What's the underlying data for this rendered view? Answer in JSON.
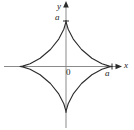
{
  "figure": {
    "type": "math-plot",
    "name": "astroid-curve",
    "background_color": "#ffffff",
    "axis_color": "#808080",
    "curve_color": "#2b2b2b",
    "text_color": "#1a1a1a"
  },
  "axes": {
    "x_axis_label": "x",
    "y_axis_label": "y",
    "origin_label": "0",
    "x_tick_label": "a",
    "y_tick_label": "a"
  },
  "chart_data": {
    "type": "line",
    "title": "",
    "xlabel": "x",
    "ylabel": "y",
    "grid": false,
    "legend": null,
    "annotations": [
      "0",
      "a",
      "a"
    ],
    "curve_equation": "x^(2/3) + y^(2/3) = a^(2/3)",
    "curve_name": "astroid",
    "parametric": {
      "x": "a*cos(t)^3",
      "y": "a*sin(t)^3",
      "t_range": [
        0,
        6.283185307179586
      ]
    },
    "a": 1,
    "xlim": [
      -1.35,
      1.35
    ],
    "ylim": [
      -1.35,
      1.35
    ],
    "cusps": [
      {
        "x": 1,
        "y": 0,
        "label": "a"
      },
      {
        "x": 0,
        "y": 1,
        "label": "a"
      },
      {
        "x": -1,
        "y": 0,
        "label": ""
      },
      {
        "x": 0,
        "y": -1,
        "label": ""
      }
    ],
    "points": [
      {
        "t": 0.0,
        "x": 1.0,
        "y": 0.0
      },
      {
        "t": 0.2,
        "x": 0.9417,
        "y": 0.0078
      },
      {
        "t": 0.4,
        "x": 0.7809,
        "y": 0.0591
      },
      {
        "t": 0.6,
        "x": 0.5622,
        "y": 0.1802
      },
      {
        "t": 0.8,
        "x": 0.3383,
        "y": 0.3694
      },
      {
        "t": 1.0,
        "x": 0.1577,
        "y": 0.5966
      },
      {
        "t": 1.2,
        "x": 0.0476,
        "y": 0.8099
      },
      {
        "t": 1.4,
        "x": 0.0046,
        "y": 0.9575
      },
      {
        "t": 1.5708,
        "x": 0.0,
        "y": 1.0
      },
      {
        "t": 1.7416,
        "x": -0.0046,
        "y": 0.9575
      },
      {
        "t": 1.9416,
        "x": -0.0476,
        "y": 0.8099
      },
      {
        "t": 2.1416,
        "x": -0.1577,
        "y": 0.5966
      },
      {
        "t": 2.3416,
        "x": -0.3383,
        "y": 0.3694
      },
      {
        "t": 2.5416,
        "x": -0.5622,
        "y": 0.1802
      },
      {
        "t": 2.7416,
        "x": -0.7809,
        "y": 0.0591
      },
      {
        "t": 2.9416,
        "x": -0.9417,
        "y": 0.0078
      },
      {
        "t": 3.1416,
        "x": -1.0,
        "y": 0.0
      },
      {
        "t": 3.3416,
        "x": -0.9417,
        "y": -0.0078
      },
      {
        "t": 3.5416,
        "x": -0.7809,
        "y": -0.0591
      },
      {
        "t": 3.7416,
        "x": -0.5622,
        "y": -0.1802
      },
      {
        "t": 3.9416,
        "x": -0.3383,
        "y": -0.3694
      },
      {
        "t": 4.1416,
        "x": -0.1577,
        "y": -0.5966
      },
      {
        "t": 4.3416,
        "x": -0.0476,
        "y": -0.8099
      },
      {
        "t": 4.5416,
        "x": -0.0046,
        "y": -0.9575
      },
      {
        "t": 4.7124,
        "x": 0.0,
        "y": -1.0
      },
      {
        "t": 4.8832,
        "x": 0.0046,
        "y": -0.9575
      },
      {
        "t": 5.0832,
        "x": 0.0476,
        "y": -0.8099
      },
      {
        "t": 5.2832,
        "x": 0.1577,
        "y": -0.5966
      },
      {
        "t": 5.4832,
        "x": 0.3383,
        "y": -0.3694
      },
      {
        "t": 5.6832,
        "x": 0.5622,
        "y": -0.1802
      },
      {
        "t": 5.8832,
        "x": 0.7809,
        "y": -0.0591
      },
      {
        "t": 6.0832,
        "x": 0.9417,
        "y": -0.0078
      },
      {
        "t": 6.2832,
        "x": 1.0,
        "y": 0.0
      }
    ]
  }
}
